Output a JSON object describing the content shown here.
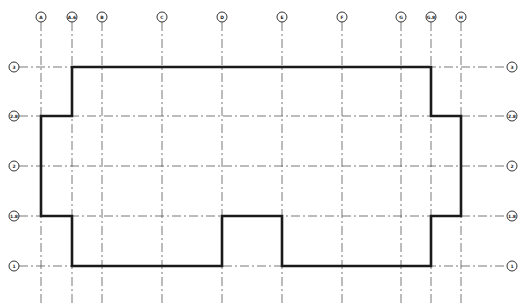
{
  "diagram": {
    "type": "structural-grid-floor-plan",
    "columns": [
      {
        "label": "A",
        "x": 41
      },
      {
        "label": "A.6",
        "x": 72
      },
      {
        "label": "B",
        "x": 102
      },
      {
        "label": "C",
        "x": 162
      },
      {
        "label": "D",
        "x": 222
      },
      {
        "label": "E",
        "x": 282
      },
      {
        "label": "F",
        "x": 342
      },
      {
        "label": "G",
        "x": 401
      },
      {
        "label": "G.8",
        "x": 431
      },
      {
        "label": "H",
        "x": 461
      }
    ],
    "rows": [
      {
        "label": "3",
        "y": 67
      },
      {
        "label": "2.8",
        "y": 116
      },
      {
        "label": "2",
        "y": 166
      },
      {
        "label": "1.8",
        "y": 216
      },
      {
        "label": "1",
        "y": 266
      }
    ],
    "column_bubble_y": 17,
    "row_bubble_left_x": 14,
    "row_bubble_right_x": 512,
    "bubble_radius": 5,
    "outline_points": [
      [
        72,
        67
      ],
      [
        431,
        67
      ],
      [
        431,
        116
      ],
      [
        461,
        116
      ],
      [
        461,
        216
      ],
      [
        431,
        216
      ],
      [
        431,
        266
      ],
      [
        282,
        266
      ],
      [
        282,
        216
      ],
      [
        222,
        216
      ],
      [
        222,
        266
      ],
      [
        72,
        266
      ],
      [
        72,
        216
      ],
      [
        41,
        216
      ],
      [
        41,
        116
      ],
      [
        72,
        116
      ]
    ],
    "colors": {
      "outline": "#1a1a1a",
      "grid": "#555555",
      "background": "#ffffff"
    }
  }
}
